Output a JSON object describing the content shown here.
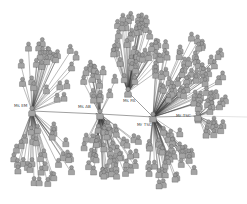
{
  "diagram": {
    "type": "network-graph",
    "node_icon": "person-icon",
    "colors": {
      "background": "#ffffff",
      "node_fill": "#a0a0a0",
      "node_stroke": "#555555",
      "edge": "#333333",
      "label": "#444444"
    },
    "hubs": [
      {
        "id": "em",
        "label": "Ms EM",
        "leaf_count": 60
      },
      {
        "id": "ab",
        "label": "Ms AB",
        "leaf_count": 65
      },
      {
        "id": "pa",
        "label": "Ms PA",
        "leaf_count": 45
      },
      {
        "id": "tsc1",
        "label": "Mr TSC",
        "leaf_count": 95
      },
      {
        "id": "tsc2",
        "label": "Mr TSC",
        "leaf_count": 22
      }
    ],
    "hub_links": [
      {
        "from": "em",
        "to": "ab"
      },
      {
        "from": "ab",
        "to": "tsc1"
      },
      {
        "from": "tsc1",
        "to": "pa"
      },
      {
        "from": "tsc1",
        "to": "tsc2"
      }
    ]
  }
}
